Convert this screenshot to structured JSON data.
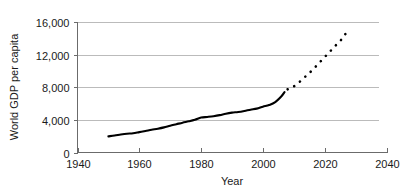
{
  "chart_data": {
    "type": "line",
    "title": "",
    "xlabel": "Year",
    "ylabel": "World GDP per capita",
    "xlim": [
      1940,
      2040
    ],
    "ylim": [
      0,
      16000
    ],
    "grid": true,
    "legend": null,
    "xticks": [
      "1940",
      "1960",
      "1980",
      "2000",
      "2020",
      "2040"
    ],
    "xtick_values": [
      1940,
      1960,
      1980,
      2000,
      2020,
      2040
    ],
    "yticks": [
      "0",
      "4,000",
      "8,000",
      "12,000",
      "16,000"
    ],
    "ytick_values": [
      0,
      4000,
      8000,
      12000,
      16000
    ],
    "series": [
      {
        "name": "historical",
        "style": "solid",
        "x": [
          1950,
          1952,
          1954,
          1956,
          1958,
          1960,
          1962,
          1964,
          1966,
          1968,
          1970,
          1972,
          1974,
          1976,
          1978,
          1980,
          1982,
          1984,
          1986,
          1988,
          1990,
          1992,
          1994,
          1996,
          1998,
          2000,
          2002,
          2004,
          2006,
          2007
        ],
        "values": [
          1980,
          2080,
          2200,
          2300,
          2360,
          2500,
          2640,
          2790,
          2920,
          3080,
          3290,
          3470,
          3660,
          3820,
          4010,
          4280,
          4360,
          4450,
          4580,
          4760,
          4890,
          4960,
          5090,
          5250,
          5380,
          5620,
          5820,
          6180,
          6900,
          7400
        ]
      },
      {
        "name": "projection",
        "style": "dotted",
        "x": [
          2008,
          2010,
          2012,
          2014,
          2016,
          2018,
          2020,
          2022,
          2024,
          2026,
          2027
        ],
        "values": [
          7750,
          8100,
          8700,
          9400,
          10100,
          10900,
          11700,
          12500,
          13300,
          14100,
          14750
        ]
      }
    ]
  },
  "axes": {
    "y_title": "World GDP per capita",
    "x_title": "Year"
  }
}
